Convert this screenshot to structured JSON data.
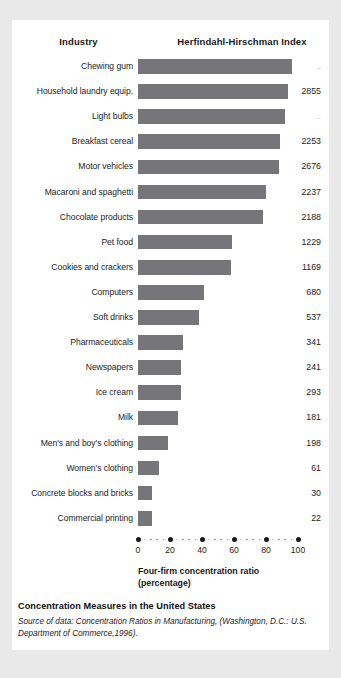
{
  "header": {
    "industry_label": "Industry",
    "index_label": "Herfindahl-Hirschman Index"
  },
  "axis": {
    "title_line1": "Four-firm concentration ratio",
    "title_line2": "(percentage)",
    "ticks": [
      "0",
      "20",
      "40",
      "60",
      "80",
      "100"
    ]
  },
  "caption": {
    "title": "Concentration Measures in the United States",
    "source": "Source of data: Concentration Ratios in Manufacturing, (Washington, D.C.: U.S. Department of Commerce,1996)."
  },
  "colors": {
    "bar": "#76767a",
    "page_background": "#e9e9e9",
    "card_background": "#ffffff",
    "text": "#1c1c1c"
  },
  "chart_data": {
    "type": "bar",
    "orientation": "horizontal",
    "title": "Concentration Measures in the United States",
    "xlabel": "Four-firm concentration ratio (percentage)",
    "ylabel": "Industry",
    "xlim": [
      0,
      100
    ],
    "grid": false,
    "legend": null,
    "categories": [
      "Chewing gum",
      "Household laundry equip.",
      "Light bulbs",
      "Breakfast cereal",
      "Motor vehicles",
      "Macaroni and spaghetti",
      "Chocolate products",
      "Pet food",
      "Cookies and crackers",
      "Computers",
      "Soft drinks",
      "Pharmaceuticals",
      "Newspapers",
      "Ice cream",
      "Milk",
      "Men's and boy's clothing",
      "Women's clothing",
      "Concrete blocks and bricks",
      "Commercial printing"
    ],
    "values": [
      96,
      94,
      92,
      89,
      88,
      80,
      78,
      59,
      58,
      41,
      38,
      28,
      27,
      27,
      25,
      19,
      13,
      9,
      9
    ],
    "annotations": [
      "2855",
      "..",
      "2253",
      "2676",
      "2237",
      "2188",
      "1229",
      "1169",
      "680",
      "537",
      "341",
      "241",
      "293",
      "181",
      "198",
      "61",
      "30",
      "22"
    ],
    "series": [
      {
        "name": "Four-firm concentration ratio (percentage)",
        "values": [
          96,
          94,
          92,
          89,
          88,
          80,
          78,
          59,
          58,
          41,
          38,
          28,
          27,
          27,
          25,
          19,
          13,
          9,
          9
        ]
      },
      {
        "name": "Herfindahl-Hirschman Index",
        "values": [
          "..",
          "2855",
          "..",
          "2253",
          "2676",
          "2237",
          "2188",
          "1229",
          "1169",
          "680",
          "537",
          "341",
          "241",
          "293",
          "181",
          "198",
          "61",
          "30",
          "22"
        ]
      }
    ]
  },
  "rows": [
    {
      "label": "Chewing gum",
      "pct": 96,
      "hhi": "..",
      "muted": true
    },
    {
      "label": "Household laundry equip.",
      "pct": 94,
      "hhi": "2855",
      "muted": false
    },
    {
      "label": "Light bulbs",
      "pct": 92,
      "hhi": "..",
      "muted": true
    },
    {
      "label": "Breakfast cereal",
      "pct": 89,
      "hhi": "2253",
      "muted": false
    },
    {
      "label": "Motor vehicles",
      "pct": 88,
      "hhi": "2676",
      "muted": false
    },
    {
      "label": "Macaroni and spaghetti",
      "pct": 80,
      "hhi": "2237",
      "muted": false
    },
    {
      "label": "Chocolate products",
      "pct": 78,
      "hhi": "2188",
      "muted": false
    },
    {
      "label": "Pet food",
      "pct": 59,
      "hhi": "1229",
      "muted": false
    },
    {
      "label": "Cookies and crackers",
      "pct": 58,
      "hhi": "1169",
      "muted": false
    },
    {
      "label": "Computers",
      "pct": 41,
      "hhi": "680",
      "muted": false
    },
    {
      "label": "Soft drinks",
      "pct": 38,
      "hhi": "537",
      "muted": false
    },
    {
      "label": "Pharmaceuticals",
      "pct": 28,
      "hhi": "341",
      "muted": false
    },
    {
      "label": "Newspapers",
      "pct": 27,
      "hhi": "241",
      "muted": false
    },
    {
      "label": "Ice cream",
      "pct": 27,
      "hhi": "293",
      "muted": false
    },
    {
      "label": "Milk",
      "pct": 25,
      "hhi": "181",
      "muted": false
    },
    {
      "label": "Men's and boy's clothing",
      "pct": 19,
      "hhi": "198",
      "muted": false
    },
    {
      "label": "Women's clothing",
      "pct": 13,
      "hhi": "61",
      "muted": false
    },
    {
      "label": "Concrete blocks and bricks",
      "pct": 9,
      "hhi": "30",
      "muted": false
    },
    {
      "label": "Commercial printing",
      "pct": 9,
      "hhi": "22",
      "muted": false
    }
  ]
}
